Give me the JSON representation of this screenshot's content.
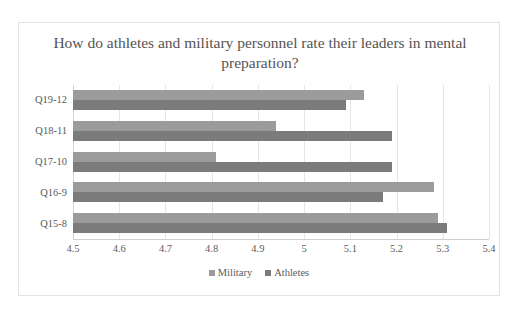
{
  "chart_data": {
    "type": "bar",
    "orientation": "horizontal",
    "title": "How do athletes and military personnel rate their leaders in mental preparation?",
    "xlabel": "",
    "ylabel": "",
    "xlim": [
      4.5,
      5.4
    ],
    "xticks": [
      "4.5",
      "4.6",
      "4.7",
      "4.8",
      "4.9",
      "5",
      "5.1",
      "5.2",
      "5.3",
      "5.4"
    ],
    "xtick_values": [
      4.5,
      4.6,
      4.7,
      4.8,
      4.9,
      5.0,
      5.1,
      5.2,
      5.3,
      5.4
    ],
    "categories": [
      "Q19-12",
      "Q18-11",
      "Q17-10",
      "Q16-9",
      "Q15-8"
    ],
    "grid": true,
    "legend_position": "bottom",
    "series": [
      {
        "name": "Military",
        "color": "#9b9b9b",
        "values": [
          5.13,
          4.94,
          4.81,
          5.28,
          5.29
        ]
      },
      {
        "name": "Athletes",
        "color": "#7b7b7b",
        "values": [
          5.09,
          5.19,
          5.19,
          5.17,
          5.31
        ]
      }
    ]
  },
  "colors": {
    "military": "#9b9b9b",
    "athletes": "#7b7b7b",
    "gridline": "#e6e6e6",
    "frame_border": "#e2e2e2",
    "text": "#595959"
  }
}
